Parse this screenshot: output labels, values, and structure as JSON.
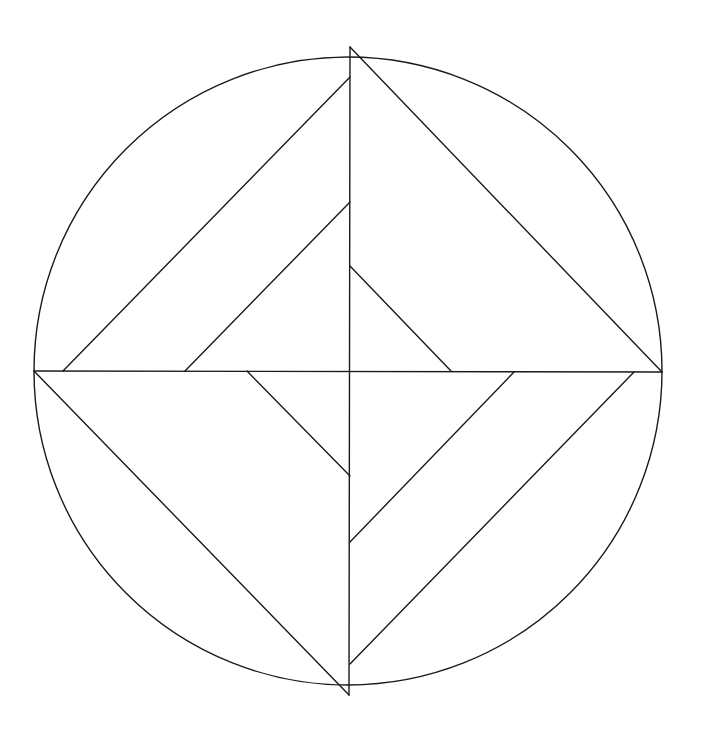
{
  "diagram": {
    "title": "",
    "background": "#ffffff",
    "stroke_color": "#1a1a1a",
    "stroke_width": 1.4,
    "circle": {
      "cx": 348,
      "cy": 371,
      "r": 314
    },
    "lines": [
      {
        "name": "vertical-diameter",
        "x1": 350,
        "y1": 47,
        "x2": 349,
        "y2": 695
      },
      {
        "name": "horizontal-diameter",
        "x1": 34,
        "y1": 371,
        "x2": 662,
        "y2": 372
      },
      {
        "name": "top-right-edge",
        "x1": 350,
        "y1": 47,
        "x2": 662,
        "y2": 372
      },
      {
        "name": "bottom-left-edge",
        "x1": 34,
        "y1": 371,
        "x2": 349,
        "y2": 695
      },
      {
        "name": "upper-left-outer-diagonal",
        "x1": 63,
        "y1": 371,
        "x2": 350,
        "y2": 77
      },
      {
        "name": "upper-left-inner-diagonal",
        "x1": 185,
        "y1": 371,
        "x2": 350,
        "y2": 202
      },
      {
        "name": "center-upper-right-diagonal",
        "x1": 350,
        "y1": 266,
        "x2": 451,
        "y2": 371
      },
      {
        "name": "center-lower-left-diagonal",
        "x1": 247,
        "y1": 371,
        "x2": 350,
        "y2": 476
      },
      {
        "name": "lower-right-inner-diagonal",
        "x1": 514,
        "y1": 372,
        "x2": 350,
        "y2": 542
      },
      {
        "name": "lower-right-outer-diagonal",
        "x1": 634,
        "y1": 372,
        "x2": 350,
        "y2": 664
      }
    ]
  }
}
